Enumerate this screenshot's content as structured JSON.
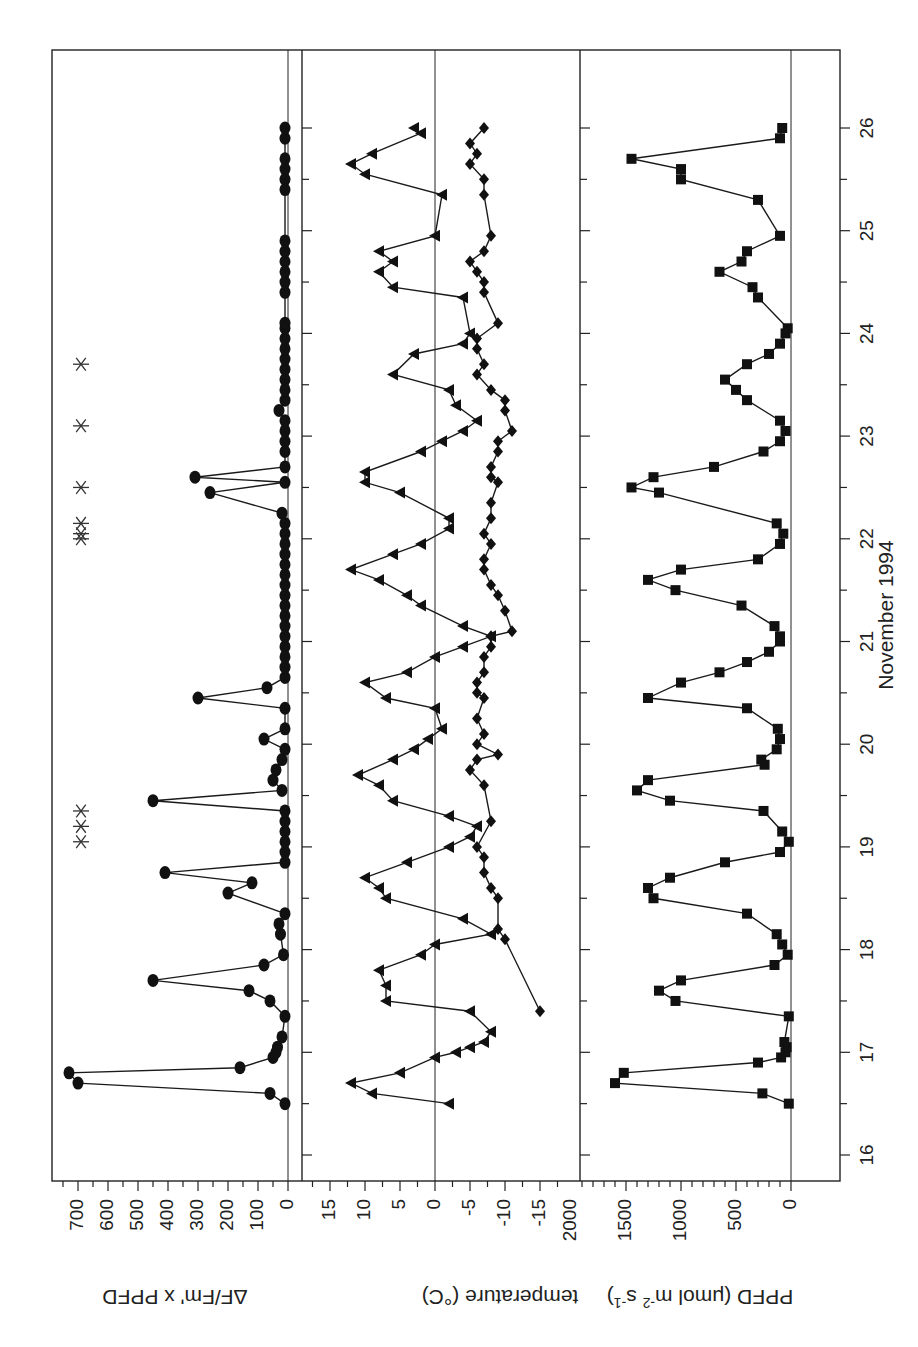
{
  "figure": {
    "orientation": "rotated-90-clockwise",
    "xlabel": "November 1994",
    "panels": [
      {
        "id": "fluorescence",
        "ylabel": "ΔF/Fm' x PPFD"
      },
      {
        "id": "temperature",
        "ylabel": "temperature (°C)"
      },
      {
        "id": "ppfd",
        "ylabel_main": "PPFD (μmol m",
        "ylabel_sup1": "-2",
        "ylabel_mid": " s",
        "ylabel_sup2": "-1",
        "ylabel_end": ")"
      }
    ]
  },
  "chart_data": [
    {
      "type": "line",
      "title": "",
      "xlabel": "November 1994",
      "ylabel": "ΔF/Fm' x PPFD",
      "xlim": [
        15.75,
        26.75
      ],
      "ylim": [
        0,
        760
      ],
      "xticks": [
        16,
        17,
        18,
        19,
        20,
        21,
        22,
        23,
        24,
        25,
        26
      ],
      "yticks": [
        0,
        100,
        200,
        300,
        400,
        500,
        600,
        700
      ],
      "grid": false,
      "series": [
        {
          "name": "ΔF/Fm' x PPFD",
          "marker": "circle",
          "x": [
            16.5,
            16.6,
            16.7,
            16.8,
            16.85,
            16.95,
            17.0,
            17.05,
            17.15,
            17.35,
            17.5,
            17.6,
            17.7,
            17.85,
            17.95,
            18.15,
            18.25,
            18.35,
            18.55,
            18.65,
            18.75,
            18.85,
            18.95,
            19.05,
            19.15,
            19.25,
            19.35,
            19.45,
            19.55,
            19.65,
            19.75,
            19.85,
            19.95,
            20.05,
            20.15,
            20.35,
            20.45,
            20.55,
            20.65,
            20.75,
            20.85,
            20.95,
            21.05,
            21.15,
            21.25,
            21.35,
            21.45,
            21.55,
            21.65,
            21.75,
            21.85,
            21.95,
            22.05,
            22.15,
            22.25,
            22.45,
            22.55,
            22.6,
            22.7,
            22.85,
            22.95,
            23.05,
            23.15,
            23.25,
            23.35,
            23.45,
            23.55,
            23.65,
            23.75,
            23.85,
            23.95,
            24.05,
            24.1,
            24.4,
            24.5,
            24.6,
            24.7,
            24.8,
            24.9,
            25.4,
            25.5,
            25.6,
            25.7,
            25.9,
            26.0
          ],
          "y": [
            10,
            60,
            700,
            730,
            160,
            50,
            40,
            35,
            20,
            10,
            60,
            130,
            450,
            80,
            15,
            25,
            30,
            10,
            200,
            120,
            410,
            10,
            10,
            10,
            10,
            10,
            10,
            450,
            20,
            50,
            40,
            20,
            10,
            80,
            10,
            10,
            300,
            70,
            10,
            10,
            10,
            10,
            10,
            10,
            10,
            10,
            10,
            10,
            10,
            10,
            10,
            10,
            10,
            10,
            20,
            260,
            10,
            310,
            10,
            10,
            10,
            10,
            10,
            30,
            10,
            10,
            10,
            10,
            10,
            10,
            10,
            10,
            10,
            10,
            10,
            10,
            10,
            10,
            10,
            10,
            10,
            10,
            10,
            10,
            10
          ]
        },
        {
          "name": "event markers",
          "marker": "asterisk",
          "x": [
            19.05,
            19.2,
            19.35,
            22.0,
            22.05,
            22.15,
            22.5,
            23.1,
            23.7
          ],
          "y": [
            690,
            690,
            690,
            690,
            690,
            690,
            690,
            690,
            690
          ]
        }
      ]
    },
    {
      "type": "line",
      "title": "",
      "xlabel": "November 1994",
      "ylabel": "temperature (°C)",
      "xlim": [
        15.75,
        26.75
      ],
      "ylim": [
        -18.5,
        18.5
      ],
      "xticks": [
        16,
        17,
        18,
        19,
        20,
        21,
        22,
        23,
        24,
        25,
        26
      ],
      "yticks": [
        -15,
        -10,
        -5,
        0,
        5,
        10,
        15
      ],
      "grid": false,
      "series": [
        {
          "name": "leaf temperature",
          "marker": "triangle",
          "x": [
            16.5,
            16.6,
            16.7,
            16.8,
            16.95,
            17.0,
            17.05,
            17.1,
            17.2,
            17.4,
            17.5,
            17.65,
            17.8,
            17.95,
            18.05,
            18.15,
            18.3,
            18.5,
            18.6,
            18.7,
            18.85,
            19.0,
            19.1,
            19.2,
            19.3,
            19.45,
            19.6,
            19.7,
            19.85,
            19.95,
            20.05,
            20.15,
            20.35,
            20.45,
            20.6,
            20.7,
            20.85,
            20.95,
            21.05,
            21.15,
            21.35,
            21.45,
            21.6,
            21.7,
            21.85,
            21.95,
            22.1,
            22.2,
            22.45,
            22.55,
            22.65,
            22.85,
            22.95,
            23.05,
            23.15,
            23.3,
            23.45,
            23.6,
            23.8,
            23.9,
            24.0,
            24.35,
            24.45,
            24.6,
            24.7,
            24.8,
            24.95,
            25.35,
            25.55,
            25.65,
            25.75,
            25.95,
            26.0
          ],
          "y": [
            -2,
            9,
            12,
            5,
            0,
            -3,
            -5,
            -7,
            -8,
            -5,
            7,
            7,
            8,
            2,
            0,
            -8,
            -4,
            7,
            8,
            10,
            4,
            -2,
            -5,
            -6,
            -2,
            6,
            8,
            11,
            6,
            3,
            1,
            -1,
            0,
            7,
            10,
            4,
            0,
            -4,
            -8,
            -4,
            2,
            4,
            8,
            12,
            6,
            2,
            -2,
            -2,
            5,
            10,
            10,
            2,
            -1,
            -4,
            -6,
            -3,
            -2,
            6,
            3,
            -4,
            -5,
            -4,
            6,
            8,
            6,
            8,
            0,
            -1,
            10,
            12,
            9,
            2,
            3
          ]
        },
        {
          "name": "air temperature",
          "marker": "diamond",
          "x": [
            17.4,
            18.1,
            18.2,
            18.5,
            18.6,
            18.75,
            18.9,
            19.0,
            19.25,
            19.6,
            19.75,
            19.85,
            19.9,
            20.0,
            20.1,
            20.25,
            20.45,
            20.5,
            20.6,
            20.7,
            20.85,
            20.95,
            21.05,
            21.1,
            21.3,
            21.45,
            21.55,
            21.7,
            21.8,
            21.95,
            22.05,
            22.2,
            22.35,
            22.55,
            22.6,
            22.7,
            22.85,
            22.95,
            23.05,
            23.25,
            23.35,
            23.45,
            23.6,
            23.7,
            23.85,
            23.95,
            24.1,
            24.4,
            24.5,
            24.6,
            24.7,
            24.8,
            24.95,
            25.35,
            25.5,
            25.65,
            25.75,
            25.85,
            26.0
          ],
          "y": [
            -15,
            -10,
            -9,
            -9,
            -8,
            -7,
            -7,
            -6,
            -8,
            -7,
            -5,
            -6,
            -9,
            -6,
            -7,
            -6,
            -7,
            -6,
            -6,
            -7,
            -7,
            -8,
            -8,
            -11,
            -10,
            -9,
            -8,
            -7,
            -7,
            -8,
            -7,
            -8,
            -8,
            -9,
            -8,
            -8,
            -9,
            -9,
            -11,
            -10,
            -10,
            -8,
            -6,
            -7,
            -6,
            -6,
            -9,
            -7,
            -7,
            -6,
            -5,
            -7,
            -8,
            -7,
            -7,
            -5,
            -6,
            -5,
            -7
          ]
        }
      ]
    },
    {
      "type": "line",
      "title": "",
      "xlabel": "November 1994",
      "ylabel": "PPFD (μmol m-2 s-1)",
      "xlim": [
        15.75,
        26.75
      ],
      "ylim": [
        0,
        2150
      ],
      "xticks": [
        16,
        17,
        18,
        19,
        20,
        21,
        22,
        23,
        24,
        25,
        26
      ],
      "yticks": [
        0,
        500,
        1000,
        1500,
        2000
      ],
      "grid": false,
      "series": [
        {
          "name": "PPFD",
          "marker": "square",
          "x": [
            16.5,
            16.6,
            16.7,
            16.8,
            16.9,
            16.95,
            17.0,
            17.05,
            17.1,
            17.35,
            17.5,
            17.6,
            17.7,
            17.85,
            17.95,
            18.05,
            18.15,
            18.35,
            18.5,
            18.6,
            18.7,
            18.85,
            18.95,
            19.05,
            19.15,
            19.35,
            19.45,
            19.55,
            19.65,
            19.8,
            19.85,
            19.95,
            20.05,
            20.15,
            20.35,
            20.45,
            20.6,
            20.7,
            20.8,
            20.9,
            21.0,
            21.05,
            21.15,
            21.35,
            21.5,
            21.6,
            21.7,
            21.8,
            21.95,
            22.05,
            22.15,
            22.45,
            22.5,
            22.6,
            22.7,
            22.85,
            22.95,
            23.05,
            23.15,
            23.35,
            23.45,
            23.55,
            23.7,
            23.8,
            23.9,
            24.0,
            24.05,
            24.35,
            24.45,
            24.6,
            24.7,
            24.8,
            24.95,
            25.3,
            25.5,
            25.6,
            25.7,
            25.9,
            26.0
          ],
          "y": [
            20,
            260,
            1600,
            1520,
            300,
            90,
            50,
            40,
            60,
            20,
            1050,
            1200,
            1000,
            150,
            30,
            80,
            130,
            400,
            1250,
            1300,
            1100,
            600,
            100,
            20,
            80,
            250,
            1100,
            1400,
            1300,
            240,
            270,
            130,
            100,
            120,
            400,
            1300,
            1000,
            650,
            400,
            200,
            100,
            100,
            150,
            450,
            1050,
            1300,
            1000,
            300,
            100,
            70,
            130,
            1200,
            1450,
            1250,
            700,
            250,
            100,
            50,
            100,
            400,
            500,
            600,
            400,
            200,
            100,
            50,
            30,
            300,
            350,
            650,
            450,
            400,
            100,
            300,
            1000,
            1000,
            1450,
            100,
            80
          ]
        }
      ]
    }
  ]
}
